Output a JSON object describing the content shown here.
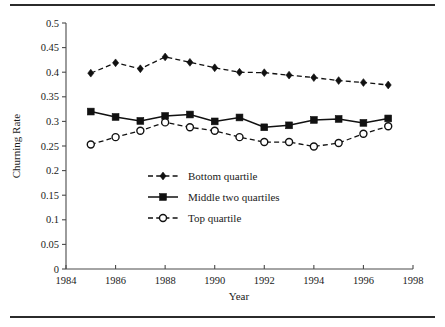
{
  "figure": {
    "has_top_rule": true,
    "has_bottom_rule": true,
    "rule_color": "#2b2b2b"
  },
  "chart_data": {
    "type": "line",
    "title": "",
    "xlabel": "Year",
    "ylabel": "Churning Rate",
    "xlim": [
      1984,
      1998
    ],
    "ylim": [
      0,
      0.5
    ],
    "grid": false,
    "legend_position": "center",
    "x": [
      1985,
      1986,
      1987,
      1988,
      1989,
      1990,
      1991,
      1992,
      1993,
      1994,
      1995,
      1996,
      1997
    ],
    "xticks": [
      1984,
      1985,
      1986,
      1987,
      1988,
      1989,
      1990,
      1991,
      1992,
      1993,
      1994,
      1995,
      1996,
      1997,
      1998
    ],
    "xticklabels": [
      "1984",
      "1986",
      "1988",
      "1990",
      "1992",
      "1994",
      "1996",
      "1998"
    ],
    "xticklabel_values": [
      1984,
      1986,
      1988,
      1990,
      1992,
      1994,
      1996,
      1998
    ],
    "yticks": [
      0,
      0.05,
      0.1,
      0.15,
      0.2,
      0.25,
      0.3,
      0.35,
      0.4,
      0.45,
      0.5
    ],
    "yticklabels": [
      "0",
      "0.05",
      "0.1",
      "0.15",
      "0.2",
      "0.25",
      "0.3",
      "0.35",
      "0.4",
      "0.45",
      "0.5"
    ],
    "series": [
      {
        "name": "Bottom quartile",
        "marker": "diamond",
        "linestyle": "dashed",
        "color": "#111111",
        "values": [
          0.398,
          0.419,
          0.407,
          0.431,
          0.42,
          0.409,
          0.4,
          0.399,
          0.394,
          0.389,
          0.383,
          0.379,
          0.374
        ]
      },
      {
        "name": "Middle two quartiles",
        "marker": "square",
        "linestyle": "solid",
        "color": "#111111",
        "values": [
          0.32,
          0.309,
          0.301,
          0.311,
          0.314,
          0.3,
          0.308,
          0.288,
          0.292,
          0.303,
          0.305,
          0.297,
          0.306
        ]
      },
      {
        "name": "Top quartile",
        "marker": "circle-open",
        "linestyle": "dashed",
        "color": "#111111",
        "values": [
          0.253,
          0.268,
          0.281,
          0.298,
          0.288,
          0.281,
          0.268,
          0.258,
          0.258,
          0.249,
          0.256,
          0.275,
          0.29
        ]
      }
    ]
  },
  "legend": {
    "items": [
      {
        "label": "Bottom quartile",
        "marker": "diamond",
        "linestyle": "dashed"
      },
      {
        "label": "Middle two quartiles",
        "marker": "square",
        "linestyle": "solid"
      },
      {
        "label": "Top quartile",
        "marker": "circle-open",
        "linestyle": "dashed"
      }
    ]
  }
}
